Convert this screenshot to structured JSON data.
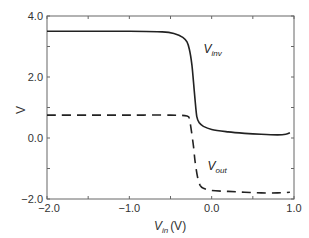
{
  "chart_data": {
    "type": "line",
    "title": "",
    "xlabel": "V_in (V)",
    "xlabel_main": "V",
    "xlabel_sub": "in",
    "xlabel_unit": "(V)",
    "ylabel": "V",
    "xlim": [
      -2.0,
      1.0
    ],
    "ylim": [
      -2.0,
      4.0
    ],
    "xticks": [
      -2.0,
      -1.0,
      0.0,
      1.0
    ],
    "xtick_labels": [
      "−2.0",
      "−1.0",
      "0.0",
      "1.0"
    ],
    "yticks": [
      -2.0,
      0.0,
      2.0,
      4.0
    ],
    "ytick_labels": [
      "−2.0",
      "0.0",
      "2.0",
      "4.0"
    ],
    "grid": false,
    "legend": "inline annotations",
    "series": [
      {
        "name": "V_inv",
        "label_main": "V",
        "label_sub": "inv",
        "style": "solid",
        "color": "#222222",
        "x": [
          -2.0,
          -1.5,
          -1.0,
          -0.6,
          -0.45,
          -0.35,
          -0.3,
          -0.27,
          -0.24,
          -0.22,
          -0.2,
          -0.18,
          -0.15,
          -0.1,
          0.0,
          0.2,
          0.4,
          0.6,
          0.8,
          0.9,
          0.95
        ],
        "y": [
          3.5,
          3.5,
          3.5,
          3.48,
          3.42,
          3.3,
          3.15,
          2.9,
          2.4,
          1.8,
          1.2,
          0.7,
          0.5,
          0.38,
          0.28,
          0.2,
          0.15,
          0.12,
          0.1,
          0.12,
          0.17
        ]
      },
      {
        "name": "V_out",
        "label_main": "V",
        "label_sub": "out",
        "style": "dashed",
        "color": "#222222",
        "x": [
          -2.0,
          -1.5,
          -1.0,
          -0.5,
          -0.3,
          -0.27,
          -0.25,
          -0.22,
          -0.2,
          -0.17,
          -0.14,
          -0.1,
          0.0,
          0.2,
          0.4,
          0.6,
          0.8,
          0.95
        ],
        "y": [
          0.75,
          0.75,
          0.75,
          0.75,
          0.72,
          0.6,
          0.3,
          -0.3,
          -0.8,
          -1.3,
          -1.55,
          -1.65,
          -1.72,
          -1.75,
          -1.78,
          -1.8,
          -1.8,
          -1.78
        ]
      }
    ],
    "annotations": [
      {
        "text": "V_inv",
        "x": -0.1,
        "y": 2.8
      },
      {
        "text": "V_out",
        "x": -0.05,
        "y": -1.05
      }
    ]
  }
}
